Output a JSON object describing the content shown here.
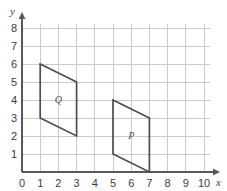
{
  "chart_data": {
    "type": "scatter",
    "title": "",
    "subtitle": "",
    "xlabel": "x",
    "ylabel": "y",
    "xlim": [
      0,
      10
    ],
    "ylim": [
      0,
      8
    ],
    "grid": true,
    "legend": null,
    "x_ticks": [
      "0",
      "1",
      "2",
      "3",
      "4",
      "5",
      "6",
      "7",
      "8",
      "9",
      "10"
    ],
    "y_ticks": [
      "0",
      "1",
      "2",
      "3",
      "4",
      "5",
      "6",
      "7",
      "8"
    ],
    "x_tick_values": [
      0,
      1,
      2,
      3,
      4,
      5,
      6,
      7,
      8,
      9,
      10
    ],
    "y_tick_values": [
      0,
      1,
      2,
      3,
      4,
      5,
      6,
      7,
      8
    ],
    "annotations": [
      {
        "name": "parallelogram-q",
        "label": "Q",
        "label_x": 2,
        "label_y": 4,
        "vertices": [
          [
            1,
            6
          ],
          [
            3,
            5
          ],
          [
            3,
            2
          ],
          [
            1,
            3
          ]
        ]
      },
      {
        "name": "parallelogram-p",
        "label": "P",
        "label_x": 6,
        "label_y": 2,
        "vertices": [
          [
            5,
            4
          ],
          [
            7,
            3
          ],
          [
            7,
            0
          ],
          [
            5,
            1
          ]
        ]
      }
    ],
    "colors": {
      "background": "#ffffff",
      "grid": "#c9cace",
      "axis": "#58595b",
      "shape_stroke": "#4d4e52",
      "tick_text": "#3c3c3c"
    }
  }
}
